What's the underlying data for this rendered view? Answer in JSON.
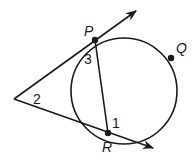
{
  "diagram": {
    "type": "geometry",
    "colors": {
      "stroke": "#1a1a1a",
      "background": "#ffffff"
    },
    "circle": {
      "cx": 124,
      "cy": 91,
      "r": 53
    },
    "points": {
      "P": {
        "label": "P",
        "x": 95,
        "y": 40
      },
      "Q": {
        "label": "Q",
        "x": 171,
        "y": 58
      },
      "R": {
        "label": "R",
        "x": 108,
        "y": 133
      },
      "V": {
        "x": 14,
        "y": 99
      }
    },
    "angles": {
      "a1": {
        "label": "1"
      },
      "a2": {
        "label": "2"
      },
      "a3": {
        "label": "3"
      }
    }
  }
}
